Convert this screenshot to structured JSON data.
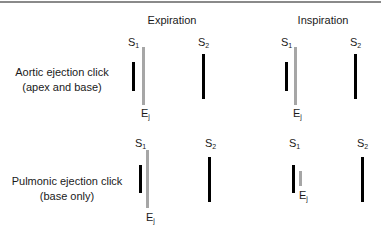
{
  "columns": [
    {
      "title": "Expiration"
    },
    {
      "title": "Inspiration"
    }
  ],
  "rows": [
    {
      "label_line1": "Aortic ejection click",
      "label_line2": "(apex and base)"
    },
    {
      "label_line1": "Pulmonic ejection click",
      "label_line2": "(base only)"
    }
  ],
  "labels": {
    "s1_main": "S",
    "s1_sub": "1",
    "s2_main": "S",
    "s2_sub": "2",
    "ej_main": "E",
    "ej_sub": "j"
  },
  "colors": {
    "heart_sound_bar": "#000000",
    "ejection_click_bar": "#a6a6a6",
    "top_rule": "#8a8a8a"
  }
}
